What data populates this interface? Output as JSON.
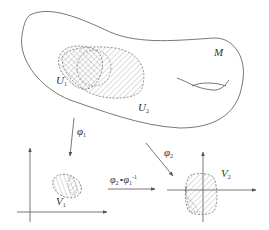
{
  "figure": {
    "colors": {
      "stroke": "#555555",
      "hatch": "#888888",
      "background": "#ffffff"
    }
  },
  "labels": {
    "manifold": "M",
    "u1": {
      "base": "U",
      "sub": "1"
    },
    "u2": {
      "base": "U",
      "sub": "2"
    },
    "v1": {
      "base": "V",
      "sub": "1"
    },
    "v2": {
      "base": "V",
      "sub": "2"
    },
    "phi1": {
      "base": "φ",
      "sub": "1"
    },
    "phi2": {
      "base": "φ",
      "sub": "2"
    },
    "transition": {
      "a": "φ",
      "a_sub": "2",
      "op": "∘",
      "b": "φ",
      "b_sub": "1",
      "b_sup": "-1"
    }
  }
}
